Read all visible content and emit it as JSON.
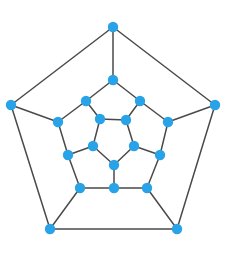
{
  "figure": {
    "background_color": "#ffffff",
    "node_color": "#29a3e8",
    "edge_color": "#4a4a4a",
    "node_radius": 5.2,
    "edge_width": 1.5,
    "node_count": 20,
    "edge_count": 30
  },
  "caption": {
    "text": ""
  },
  "chart_data": {
    "type": "graph",
    "layout": "concentric-pentagons",
    "node_count": 20,
    "edge_count": 30,
    "width": 232,
    "height": 256,
    "nodes": [
      {
        "id": "o0",
        "ring": "outer",
        "label": "",
        "x": 113,
        "y": 27
      },
      {
        "id": "o1",
        "ring": "outer",
        "label": "",
        "x": 215,
        "y": 105
      },
      {
        "id": "o2",
        "ring": "outer",
        "label": "",
        "x": 177,
        "y": 229
      },
      {
        "id": "o3",
        "ring": "outer",
        "label": "",
        "x": 50,
        "y": 229
      },
      {
        "id": "o4",
        "ring": "outer",
        "label": "",
        "x": 11,
        "y": 105
      },
      {
        "id": "m0",
        "ring": "upper-middle",
        "label": "",
        "x": 113,
        "y": 80
      },
      {
        "id": "m1",
        "ring": "upper-middle",
        "label": "",
        "x": 168,
        "y": 122
      },
      {
        "id": "m2",
        "ring": "upper-middle",
        "label": "",
        "x": 147,
        "y": 188
      },
      {
        "id": "m3",
        "ring": "upper-middle",
        "label": "",
        "x": 80,
        "y": 188
      },
      {
        "id": "m4",
        "ring": "upper-middle",
        "label": "",
        "x": 58,
        "y": 122
      },
      {
        "id": "n0",
        "ring": "lower-middle",
        "label": "",
        "x": 140,
        "y": 101
      },
      {
        "id": "n1",
        "ring": "lower-middle",
        "label": "",
        "x": 160,
        "y": 155
      },
      {
        "id": "n2",
        "ring": "lower-middle",
        "label": "",
        "x": 114,
        "y": 188
      },
      {
        "id": "n3",
        "ring": "lower-middle",
        "label": "",
        "x": 68,
        "y": 155
      },
      {
        "id": "n4",
        "ring": "lower-middle",
        "label": "",
        "x": 86,
        "y": 101
      },
      {
        "id": "i0",
        "ring": "inner",
        "label": "",
        "x": 126,
        "y": 120
      },
      {
        "id": "i1",
        "ring": "inner",
        "label": "",
        "x": 134,
        "y": 146
      },
      {
        "id": "i2",
        "ring": "inner",
        "label": "",
        "x": 114,
        "y": 165
      },
      {
        "id": "i3",
        "ring": "inner",
        "label": "",
        "x": 93,
        "y": 146
      },
      {
        "id": "i4",
        "ring": "inner",
        "label": "",
        "x": 100,
        "y": 119
      }
    ],
    "edges": [
      {
        "source": "o0",
        "target": "o1"
      },
      {
        "source": "o1",
        "target": "o2"
      },
      {
        "source": "o2",
        "target": "o3"
      },
      {
        "source": "o3",
        "target": "o4"
      },
      {
        "source": "o4",
        "target": "o0"
      },
      {
        "source": "o0",
        "target": "m0"
      },
      {
        "source": "o1",
        "target": "m1"
      },
      {
        "source": "o2",
        "target": "m2"
      },
      {
        "source": "o3",
        "target": "m3"
      },
      {
        "source": "o4",
        "target": "m4"
      },
      {
        "source": "m0",
        "target": "n0"
      },
      {
        "source": "n0",
        "target": "m1"
      },
      {
        "source": "m1",
        "target": "n1"
      },
      {
        "source": "n1",
        "target": "m2"
      },
      {
        "source": "m2",
        "target": "n2"
      },
      {
        "source": "n2",
        "target": "m3"
      },
      {
        "source": "m3",
        "target": "n3"
      },
      {
        "source": "n3",
        "target": "m4"
      },
      {
        "source": "m4",
        "target": "n4"
      },
      {
        "source": "n4",
        "target": "m0"
      },
      {
        "source": "n0",
        "target": "i0"
      },
      {
        "source": "n1",
        "target": "i1"
      },
      {
        "source": "n2",
        "target": "i2"
      },
      {
        "source": "n3",
        "target": "i3"
      },
      {
        "source": "n4",
        "target": "i4"
      },
      {
        "source": "i0",
        "target": "i1"
      },
      {
        "source": "i1",
        "target": "i2"
      },
      {
        "source": "i2",
        "target": "i3"
      },
      {
        "source": "i3",
        "target": "i4"
      },
      {
        "source": "i4",
        "target": "i0"
      }
    ]
  }
}
